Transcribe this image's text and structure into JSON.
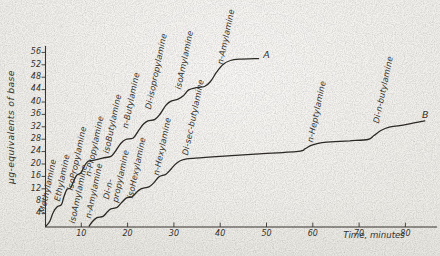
{
  "colors": {
    "ink": "#2e2b26",
    "axis": "#3a3732",
    "paper": "#f0eeea",
    "text": "#35322c"
  },
  "chart_data": {
    "type": "line",
    "title": "",
    "xlabel": "Time, minutes",
    "ylabel": "μg-equivalents of base",
    "xlim": [
      0,
      87
    ],
    "ylim": [
      0,
      58
    ],
    "grid": false,
    "legend_position": "none",
    "x_ticks": [
      10,
      20,
      30,
      40,
      50,
      60,
      70,
      80
    ],
    "y_ticks": [
      4,
      8,
      12,
      16,
      20,
      24,
      28,
      32,
      36,
      40,
      44,
      48,
      52,
      56
    ],
    "series": [
      {
        "name": "A",
        "description": "stepwise elution curve A",
        "points": [
          [
            2.4,
            0
          ],
          [
            3.2,
            1.5
          ],
          [
            3.9,
            4.3
          ],
          [
            4.8,
            6.2
          ],
          [
            5.7,
            6.9
          ],
          [
            6.2,
            9.2
          ],
          [
            6.9,
            11.8
          ],
          [
            7.7,
            12.3
          ],
          [
            8.3,
            14.3
          ],
          [
            9,
            16.4
          ],
          [
            9.9,
            17.1
          ],
          [
            10.6,
            19.2
          ],
          [
            11.4,
            20.8
          ],
          [
            12.6,
            21.2
          ],
          [
            14.6,
            21.9
          ],
          [
            16.4,
            22.5
          ],
          [
            17.4,
            24.2
          ],
          [
            18.5,
            26.6
          ],
          [
            19.6,
            27.9
          ],
          [
            21.2,
            28.4
          ],
          [
            22.3,
            30.6
          ],
          [
            23.4,
            32.8
          ],
          [
            24.4,
            33.9
          ],
          [
            25.9,
            34.4
          ],
          [
            27.1,
            36.3
          ],
          [
            28.3,
            39
          ],
          [
            29.4,
            40.3
          ],
          [
            30.9,
            40.9
          ],
          [
            32.1,
            42.1
          ],
          [
            33.2,
            43.9
          ],
          [
            34.8,
            44.6
          ],
          [
            36.6,
            45
          ],
          [
            37.9,
            46.6
          ],
          [
            39.2,
            49.6
          ],
          [
            40.6,
            52.1
          ],
          [
            42.2,
            53.4
          ],
          [
            44.1,
            53.8
          ],
          [
            48.3,
            54
          ]
        ]
      },
      {
        "name": "B",
        "description": "stepwise elution curve B",
        "points": [
          [
            11.7,
            0
          ],
          [
            12.5,
            1.6
          ],
          [
            13.4,
            2.7
          ],
          [
            14.7,
            3.1
          ],
          [
            15.6,
            4.5
          ],
          [
            16.4,
            5.5
          ],
          [
            17.7,
            6
          ],
          [
            18.6,
            7.4
          ],
          [
            19.7,
            9
          ],
          [
            21,
            9.5
          ],
          [
            21.9,
            10.8
          ],
          [
            22.9,
            12
          ],
          [
            24.6,
            12.6
          ],
          [
            25.7,
            14
          ],
          [
            26.8,
            15.9
          ],
          [
            28.3,
            16.7
          ],
          [
            29.4,
            18.4
          ],
          [
            30.5,
            20.2
          ],
          [
            32,
            21.4
          ],
          [
            34.6,
            21.9
          ],
          [
            40,
            22.5
          ],
          [
            47.5,
            23.2
          ],
          [
            56.8,
            24.1
          ],
          [
            58.3,
            24.9
          ],
          [
            59.8,
            26.1
          ],
          [
            62,
            26.9
          ],
          [
            65.9,
            27.3
          ],
          [
            68,
            27.5
          ],
          [
            71.9,
            27.9
          ],
          [
            73.2,
            29.2
          ],
          [
            74.7,
            30.8
          ],
          [
            76.5,
            31.9
          ],
          [
            78.8,
            32.4
          ],
          [
            81.6,
            33.2
          ],
          [
            84.2,
            33.9
          ]
        ]
      }
    ],
    "annotations": [
      {
        "series": "A",
        "text": "Methylamine",
        "t": 2.4,
        "v": 3.9,
        "rot": -78,
        "kind": "step"
      },
      {
        "series": "A",
        "text": "Ethylamine",
        "t": 5.6,
        "v": 7.7,
        "rot": -78,
        "kind": "step"
      },
      {
        "series": "A",
        "text": "isoPropylamine",
        "t": 8.4,
        "v": 11.3,
        "rot": -78,
        "kind": "step"
      },
      {
        "series": "A",
        "text": "n-Propylamine",
        "t": 12.3,
        "v": 15.8,
        "rot": -78,
        "kind": "step"
      },
      {
        "series": "A",
        "text": "isoButylamine",
        "t": 16.2,
        "v": 23.2,
        "rot": -78,
        "kind": "step"
      },
      {
        "series": "A",
        "text": "n-Butylamine",
        "t": 20.3,
        "v": 31.3,
        "rot": -78,
        "kind": "step"
      },
      {
        "series": "A",
        "text": "Di-isopropylamine",
        "t": 25.3,
        "v": 37.4,
        "rot": -78,
        "kind": "step"
      },
      {
        "series": "A",
        "text": "isoAmylamine",
        "t": 31.7,
        "v": 43.9,
        "rot": -78,
        "kind": "step"
      },
      {
        "series": "A",
        "text": "n-Amylamine",
        "t": 40.8,
        "v": 51.9,
        "rot": -78,
        "kind": "step"
      },
      {
        "series": "B",
        "text": "isoAmylamine",
        "t": 8.9,
        "v": 0.6,
        "rot": -78,
        "kind": "step"
      },
      {
        "series": "B",
        "text": "n-Amylamine",
        "t": 12.3,
        "v": 2.3,
        "rot": -78,
        "kind": "step"
      },
      {
        "series": "B",
        "text": "Di-n-",
        "t": 16.2,
        "v": 8.4,
        "rot": -78,
        "kind": "step"
      },
      {
        "series": "B",
        "text": "propylamine",
        "t": 18.1,
        "v": 7.4,
        "rot": -78,
        "kind": "step"
      },
      {
        "series": "B",
        "text": "isoHexylamine",
        "t": 21.4,
        "v": 8.7,
        "rot": -78,
        "kind": "step"
      },
      {
        "series": "B",
        "text": "n-Hexylamine",
        "t": 27,
        "v": 16.1,
        "rot": -78,
        "kind": "step"
      },
      {
        "series": "B",
        "text": "Di-sec-butylamine",
        "t": 33.3,
        "v": 22.6,
        "rot": -78,
        "kind": "step"
      },
      {
        "series": "B",
        "text": "n-Heptylamine",
        "t": 60.3,
        "v": 26.8,
        "rot": -78,
        "kind": "step"
      },
      {
        "series": "B",
        "text": "Di-n-butylamine",
        "t": 74.5,
        "v": 32.9,
        "rot": -78,
        "kind": "step"
      },
      {
        "series": "A",
        "text": "A",
        "t": 49.3,
        "v": 53.8,
        "rot": 0,
        "kind": "endpoint"
      },
      {
        "series": "B",
        "text": "B",
        "t": 83.6,
        "v": 34.6,
        "rot": 0,
        "kind": "endpoint"
      }
    ]
  }
}
